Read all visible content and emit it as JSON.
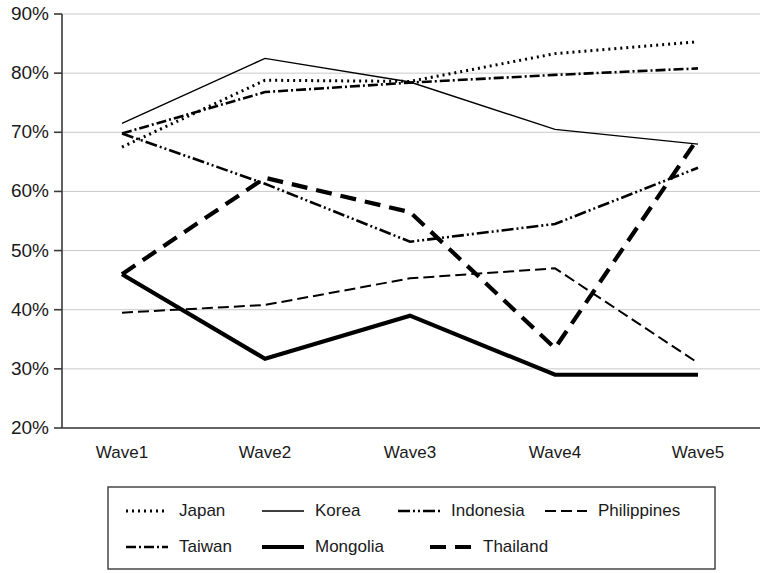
{
  "chart_data": {
    "type": "line",
    "title": "",
    "xlabel": "",
    "ylabel": "",
    "categories": [
      "Wave1",
      "Wave2",
      "Wave3",
      "Wave4",
      "Wave5"
    ],
    "ylim": [
      20,
      90
    ],
    "y_tick_labels": [
      "20%",
      "30%",
      "40%",
      "50%",
      "60%",
      "70%",
      "80%",
      "90%"
    ],
    "y_tick_values": [
      20,
      30,
      40,
      50,
      60,
      70,
      80,
      90
    ],
    "grid": true,
    "legend_position": "bottom",
    "value_suffix": "%",
    "series": [
      {
        "name": "Japan",
        "style": "dotted",
        "dash": "2,4",
        "width": 3,
        "values": [
          67.5,
          78.8,
          78.6,
          83.3,
          85.3
        ]
      },
      {
        "name": "Korea",
        "style": "solid-thin",
        "dash": "none",
        "width": 1.4,
        "values": [
          71.5,
          82.5,
          78.5,
          70.5,
          68.0
        ]
      },
      {
        "name": "Indonesia",
        "style": "dash-dot-dot",
        "dash": "12,3,2,3,2,3",
        "width": 2.6,
        "values": [
          69.8,
          61.3,
          51.5,
          54.5,
          64.0
        ]
      },
      {
        "name": "Philippines",
        "style": "dashed",
        "dash": "11,5",
        "width": 2.0,
        "values": [
          39.5,
          40.8,
          45.3,
          47.0,
          31.0
        ]
      },
      {
        "name": "Taiwan",
        "style": "dash-dot",
        "dash": "10,3,2,3",
        "width": 2.6,
        "values": [
          69.8,
          76.8,
          78.4,
          79.7,
          80.8
        ]
      },
      {
        "name": "Mongolia",
        "style": "solid-thick",
        "dash": "none",
        "width": 4.2,
        "values": [
          46.0,
          31.7,
          39.0,
          29.0,
          29.0
        ]
      },
      {
        "name": "Thailand",
        "style": "dashed-thick",
        "dash": "16,9",
        "width": 4.2,
        "values": [
          46.0,
          62.3,
          56.5,
          33.5,
          69.0
        ]
      }
    ],
    "legend_rows": [
      [
        "Japan",
        "Korea",
        "Indonesia",
        "Philippines"
      ],
      [
        "Taiwan",
        "Mongolia",
        "Thailand"
      ]
    ]
  }
}
